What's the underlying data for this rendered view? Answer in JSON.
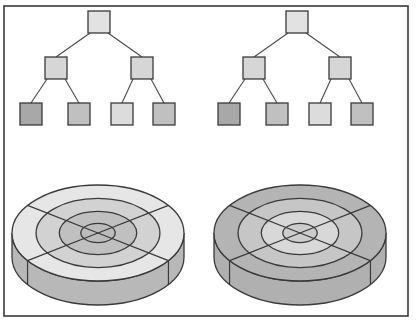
{
  "figure": {
    "background_color": "#ffffff",
    "width": 417,
    "height": 326,
    "frame": {
      "name": "figure-border",
      "stroke": "#3a3a3a",
      "stroke_width": 1.6,
      "x": 4,
      "y": 6,
      "width": 404,
      "height": 310
    },
    "palette": {
      "outline": "#3a3a3a",
      "edge_line": "#4a4a4a",
      "node_light": "#e2e2e2",
      "node_mid_light": "#d6d6d6",
      "node_mid": "#c6c6c6",
      "node_dark": "#a8a8a8",
      "node_darker": "#9c9c9c",
      "disk_lightest": "#eaeaea",
      "disk_light": "#dcdcdc",
      "disk_mid": "#c9c9c9",
      "disk_dark": "#b2b2b2",
      "disk_darker": "#a0a0a0",
      "disk_side": "#b8b8b8",
      "disk_side_dark": "#a4a4a4"
    },
    "panels": [
      {
        "name": "tree-left",
        "kind": "binary-tree",
        "levels": 3,
        "node_count": 7,
        "node_size": 22,
        "center_x": 99,
        "nodes": [
          {
            "id": "L-root",
            "level": 0,
            "x": 99,
            "y": 22,
            "fill": "#e2e2e2"
          },
          {
            "id": "L-i1",
            "level": 1,
            "x": 56,
            "y": 68,
            "fill": "#d6d6d6"
          },
          {
            "id": "L-i2",
            "level": 1,
            "x": 142,
            "y": 68,
            "fill": "#d6d6d6"
          },
          {
            "id": "L-leaf1",
            "level": 2,
            "x": 31,
            "y": 114,
            "fill": "#a8a8a8"
          },
          {
            "id": "L-leaf2",
            "level": 2,
            "x": 79,
            "y": 114,
            "fill": "#c0c0c0"
          },
          {
            "id": "L-leaf3",
            "level": 2,
            "x": 122,
            "y": 114,
            "fill": "#dcdcdc"
          },
          {
            "id": "L-leaf4",
            "level": 2,
            "x": 164,
            "y": 114,
            "fill": "#c0c0c0"
          }
        ],
        "edges": [
          {
            "from": "L-root",
            "to": "L-i1"
          },
          {
            "from": "L-root",
            "to": "L-i2"
          },
          {
            "from": "L-i1",
            "to": "L-leaf1"
          },
          {
            "from": "L-i1",
            "to": "L-leaf2"
          },
          {
            "from": "L-i2",
            "to": "L-leaf3"
          },
          {
            "from": "L-i2",
            "to": "L-leaf4"
          }
        ]
      },
      {
        "name": "tree-right",
        "kind": "binary-tree",
        "levels": 3,
        "node_count": 7,
        "node_size": 22,
        "center_x": 297,
        "nodes": [
          {
            "id": "R-root",
            "level": 0,
            "x": 297,
            "y": 22,
            "fill": "#e2e2e2"
          },
          {
            "id": "R-i1",
            "level": 1,
            "x": 254,
            "y": 68,
            "fill": "#d6d6d6"
          },
          {
            "id": "R-i2",
            "level": 1,
            "x": 340,
            "y": 68,
            "fill": "#d6d6d6"
          },
          {
            "id": "R-leaf1",
            "level": 2,
            "x": 229,
            "y": 114,
            "fill": "#a8a8a8"
          },
          {
            "id": "R-leaf2",
            "level": 2,
            "x": 277,
            "y": 114,
            "fill": "#c0c0c0"
          },
          {
            "id": "R-leaf3",
            "level": 2,
            "x": 320,
            "y": 114,
            "fill": "#dcdcdc"
          },
          {
            "id": "R-leaf4",
            "level": 2,
            "x": 362,
            "y": 114,
            "fill": "#c0c0c0"
          }
        ],
        "edges": [
          {
            "from": "R-root",
            "to": "R-i1"
          },
          {
            "from": "R-root",
            "to": "R-i2"
          },
          {
            "from": "R-i1",
            "to": "R-leaf1"
          },
          {
            "from": "R-i1",
            "to": "R-leaf2"
          },
          {
            "from": "R-i2",
            "to": "R-leaf3"
          },
          {
            "from": "R-i2",
            "to": "R-leaf4"
          }
        ]
      },
      {
        "name": "disk-left",
        "kind": "disk-platter",
        "center_x": 98,
        "center_y": 233,
        "radius_x": 86,
        "radius_y": 48,
        "thickness": 24,
        "track_count": 4,
        "track_radii_ratio": [
          1.0,
          0.72,
          0.45,
          0.2
        ],
        "sector_count": 4,
        "sector_divider_angles_deg": [
          35,
          145,
          215,
          325
        ],
        "surface_shades": [
          "#e6e6e6",
          "#d2d2d2",
          "#c0c0c0",
          "#bcbcbc"
        ],
        "side_shade": "#b8b8b8",
        "side_shade_dark": "#a6a6a6"
      },
      {
        "name": "disk-right",
        "kind": "disk-platter",
        "center_x": 300,
        "center_y": 233,
        "radius_x": 86,
        "radius_y": 48,
        "thickness": 24,
        "track_count": 4,
        "track_radii_ratio": [
          1.0,
          0.72,
          0.45,
          0.2
        ],
        "sector_count": 4,
        "sector_divider_angles_deg": [
          35,
          145,
          215,
          325
        ],
        "surface_shades": [
          "#b4b4b4",
          "#c6c6c6",
          "#d8d8d8",
          "#cccccc"
        ],
        "side_shade": "#b0b0b0",
        "side_shade_dark": "#9e9e9e"
      }
    ]
  }
}
